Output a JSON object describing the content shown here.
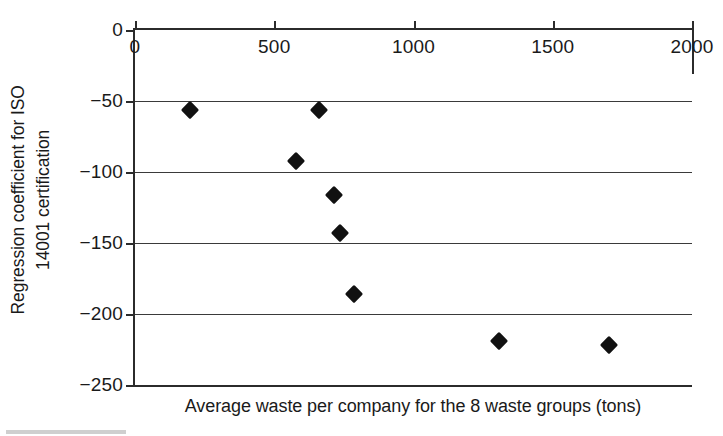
{
  "chart_data": {
    "type": "scatter",
    "title": "",
    "xlabel": "Average waste per company for the 8 waste groups (tons)",
    "ylabel": "Regression coefficient for ISO 14001 certification",
    "ylabel_lines": [
      "Regression coefficient for ISO",
      "14001 certification"
    ],
    "xlim": [
      0,
      2000
    ],
    "ylim": [
      -250,
      0
    ],
    "xticks": [
      0,
      500,
      1000,
      1500,
      2000
    ],
    "yticks": [
      0,
      -50,
      -100,
      -150,
      -200,
      -250
    ],
    "xtick_labels": [
      "0",
      "500",
      "1000",
      "1500",
      "2000"
    ],
    "ytick_labels": [
      "0",
      "−50",
      "−100",
      "−150",
      "−200",
      "−250"
    ],
    "grid": true,
    "grid_axis": "y",
    "legend": false,
    "marker": "diamond",
    "marker_color": "#111111",
    "points": [
      {
        "x": 197,
        "y": -56
      },
      {
        "x": 660,
        "y": -56
      },
      {
        "x": 578,
        "y": -92
      },
      {
        "x": 714,
        "y": -116
      },
      {
        "x": 736,
        "y": -143
      },
      {
        "x": 786,
        "y": -186
      },
      {
        "x": 1307,
        "y": -219
      },
      {
        "x": 1702,
        "y": -222
      }
    ],
    "x": [
      197,
      660,
      578,
      714,
      736,
      786,
      1307,
      1702
    ],
    "values": [
      -56,
      -56,
      -92,
      -116,
      -143,
      -186,
      -219,
      -222
    ],
    "n_points": 8
  },
  "axis_color": "#2b2b2b",
  "grid_color": "#3a3a3a",
  "background": "#ffffff"
}
